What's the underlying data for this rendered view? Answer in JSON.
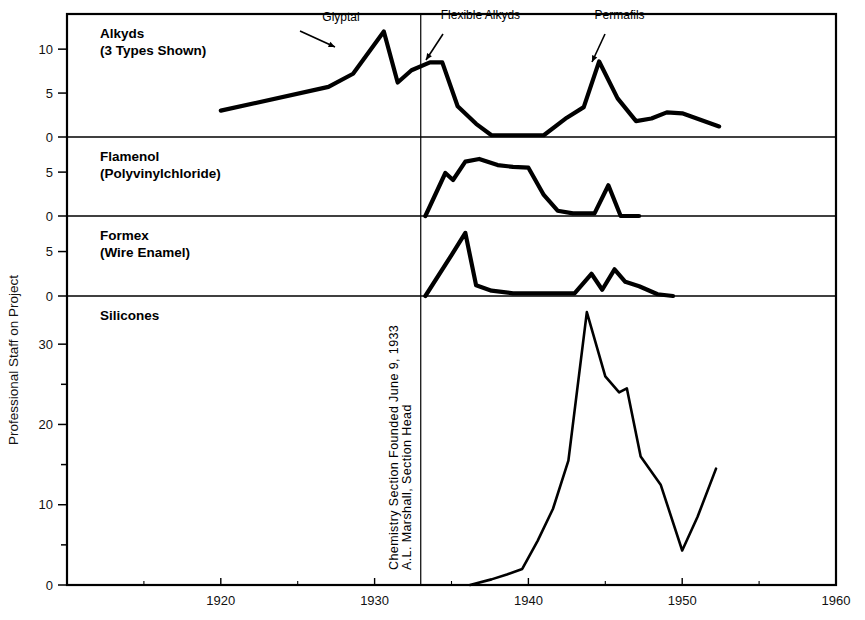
{
  "chart_data": {
    "type": "line",
    "title": "",
    "xlabel": "",
    "ylabel": "Professional Staff on Project",
    "xlim": [
      1910,
      1960
    ],
    "grid": false,
    "legend": "none",
    "xticks": [
      1920,
      1930,
      1940,
      1950,
      1960
    ],
    "xticklabels": [
      "1920",
      "1930",
      "1940",
      "1950",
      "1960"
    ],
    "xminorticks": [
      1915,
      1925,
      1935,
      1945,
      1955
    ],
    "panels": [
      {
        "name": "alkyds",
        "label_line1": "Alkyds",
        "label_line2": "(3 Types Shown)",
        "ylim": [
          0,
          14
        ],
        "yticks": [
          0,
          5,
          10
        ],
        "yticklabels": [
          "0",
          "5",
          "10"
        ],
        "series": [
          {
            "name": "Alkyds (3 types)",
            "x": [
              1920.0,
              1927.0,
              1928.6,
              1930.6,
              1931.5,
              1932.4,
              1933.6,
              1934.4,
              1935.4,
              1936.6,
              1937.6,
              1939.0,
              1941.0,
              1942.5,
              1943.6,
              1944.6,
              1945.8,
              1947.0,
              1948.0,
              1949.0,
              1950.0,
              1952.4
            ],
            "y": [
              3.0,
              5.7,
              7.2,
              12.0,
              6.2,
              7.6,
              8.5,
              8.5,
              3.5,
              1.5,
              0.2,
              0.2,
              0.2,
              2.2,
              3.4,
              8.6,
              4.4,
              1.8,
              2.1,
              2.8,
              2.7,
              1.2,
              0.0
            ]
          }
        ],
        "annotations": [
          {
            "text": "Glyptal",
            "x": 1926.6,
            "y": 13.2
          },
          {
            "text": "Flexible Alkyds",
            "x": 1934.3,
            "y": 13.4
          },
          {
            "text": "Permafils",
            "x": 1944.3,
            "y": 13.4
          }
        ]
      },
      {
        "name": "flamenol",
        "label_line1": "Flamenol",
        "label_line2": "(Polyvinylchloride)",
        "ylim": [
          0,
          9
        ],
        "yticks": [
          0,
          5
        ],
        "yticklabels": [
          "0",
          "5"
        ],
        "series": [
          {
            "name": "Flamenol (Polyvinylchloride)",
            "x": [
              1933.3,
              1934.6,
              1935.1,
              1935.9,
              1936.8,
              1938.0,
              1939.0,
              1940.0,
              1941.0,
              1941.9,
              1942.9,
              1944.3,
              1945.2,
              1946.0,
              1946.6,
              1947.2
            ],
            "y": [
              0.0,
              4.9,
              4.1,
              6.2,
              6.5,
              5.8,
              5.6,
              5.5,
              2.4,
              0.6,
              0.3,
              0.3,
              3.5,
              0.0,
              0.0,
              0.0
            ]
          }
        ],
        "annotations": []
      },
      {
        "name": "formex",
        "label_line1": "Formex",
        "label_line2": "(Wire Enamel)",
        "ylim": [
          0,
          9
        ],
        "yticks": [
          0,
          5
        ],
        "yticklabels": [
          "0",
          "5"
        ],
        "series": [
          {
            "name": "Formex (Wire Enamel)",
            "x": [
              1933.3,
              1935.0,
              1935.9,
              1936.6,
              1937.6,
              1939.0,
              1941.0,
              1943.0,
              1944.1,
              1944.8,
              1945.6,
              1946.3,
              1947.2,
              1948.4,
              1949.4
            ],
            "y": [
              0.0,
              4.6,
              7.1,
              1.2,
              0.6,
              0.3,
              0.3,
              0.3,
              2.5,
              0.7,
              3.0,
              1.6,
              1.1,
              0.2,
              0.0
            ]
          }
        ],
        "annotations": []
      },
      {
        "name": "silicones",
        "label_line1": "Silicones",
        "label_line2": "",
        "ylim": [
          0,
          36
        ],
        "yticks": [
          0,
          5,
          10,
          15,
          20,
          25,
          30
        ],
        "yticklabels": [
          "0",
          "",
          "10",
          "",
          "20",
          "",
          "30"
        ],
        "series": [
          {
            "name": "Silicones",
            "x": [
              1936.2,
              1937.6,
              1938.6,
              1939.6,
              1940.6,
              1941.6,
              1942.6,
              1943.8,
              1945.0,
              1945.9,
              1946.4,
              1947.3,
              1948.6,
              1950.0,
              1951.0,
              1952.2
            ],
            "y": [
              0.0,
              0.7,
              1.3,
              2.0,
              5.5,
              9.5,
              15.5,
              34.0,
              26.0,
              24.0,
              24.5,
              16.0,
              12.5,
              4.3,
              8.5,
              14.5
            ]
          }
        ],
        "annotations": []
      }
    ],
    "divider": {
      "x": 1933.0,
      "note_line1": "Chemistry Section Founded June 9, 1933",
      "note_line2": "A.L. Marshall, Section Head"
    }
  }
}
